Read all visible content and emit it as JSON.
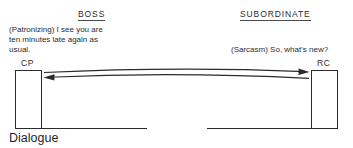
{
  "diagram": {
    "caption": "Dialogue",
    "columns": [
      {
        "heading": "BOSS",
        "speech": "(Patronizing) I see you are\nten minutes late again as\nusual."
      },
      {
        "heading": "SUBORDINATE",
        "speech": "(Sarcasm) So, what's new?"
      }
    ],
    "ego_states": [
      {
        "label": "CP",
        "side": "left"
      },
      {
        "label": "RC",
        "side": "right"
      }
    ],
    "transactions": [
      {
        "from": "CP",
        "to": "RC",
        "direction": "left-to-right",
        "style": "solid-curved"
      },
      {
        "from": "RC",
        "to": "CP",
        "direction": "right-to-left",
        "style": "solid-curved"
      }
    ],
    "colors": {
      "ink": "#2b2b2b",
      "caption_ink": "#1f1f1f",
      "background": "#ffffff"
    }
  }
}
